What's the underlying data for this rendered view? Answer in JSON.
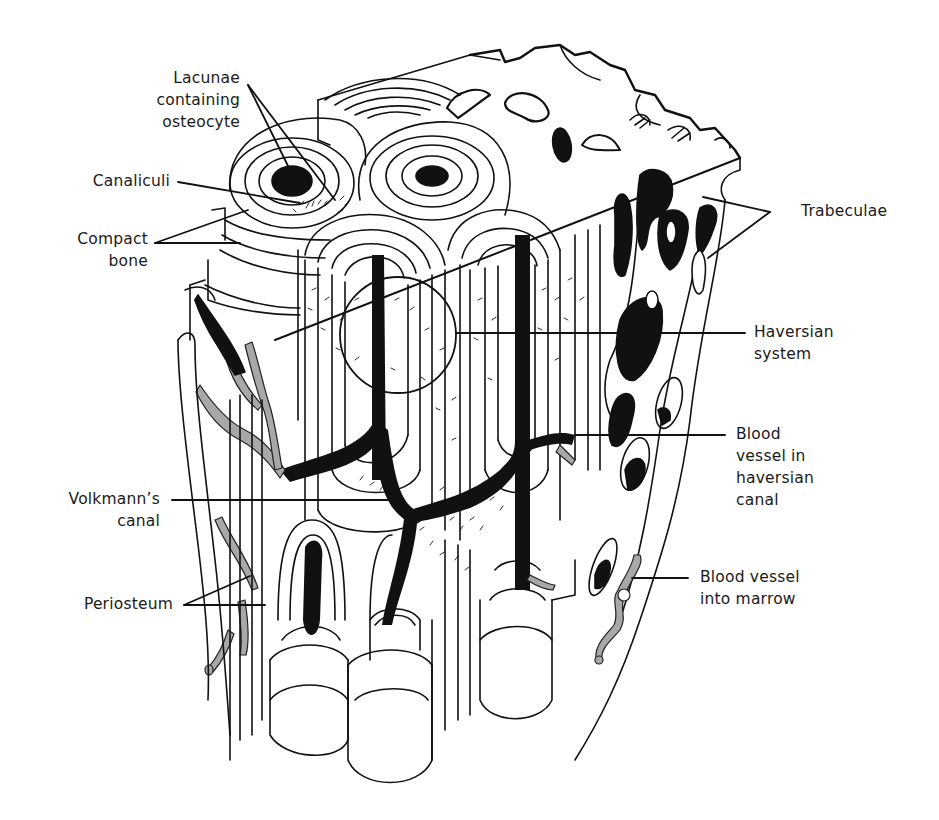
{
  "figure": {
    "colors": {
      "ink": "#111111",
      "vessel_gray": "#a8a8a8",
      "background": "#ffffff"
    }
  },
  "labels": {
    "lacunae": {
      "lines": [
        "Lacunae",
        "containing",
        "osteocyte"
      ]
    },
    "canaliculi": {
      "lines": [
        "Canaliculi"
      ]
    },
    "compact_bone": {
      "lines": [
        "Compact",
        "bone"
      ]
    },
    "trabeculae": {
      "lines": [
        "Trabeculae"
      ]
    },
    "haversian_system": {
      "lines": [
        "Haversian",
        "system"
      ]
    },
    "blood_vessel_haversian": {
      "lines": [
        "Blood",
        "vessel in",
        "haversian",
        "canal"
      ]
    },
    "volkmanns_canal": {
      "lines": [
        "Volkmann’s",
        "canal"
      ]
    },
    "periosteum": {
      "lines": [
        "Periosteum"
      ]
    },
    "blood_vessel_marrow": {
      "lines": [
        "Blood vessel",
        "into marrow"
      ]
    }
  }
}
